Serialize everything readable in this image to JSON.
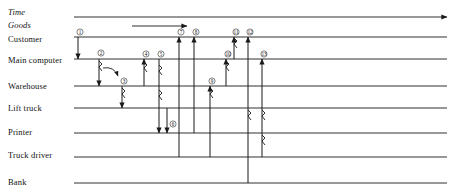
{
  "diagram": {
    "kind": "interaction-sequence-diagram",
    "colors": {
      "line": "#1a1a1a",
      "text": "#111111",
      "background": "#ffffff"
    },
    "geometry": {
      "line_start_x": 74,
      "line_end_x": 447,
      "label_x": 8
    },
    "axes": [
      {
        "id": "time",
        "label": "Time",
        "label_y": 14,
        "line_y": 17,
        "arrow": true,
        "x1": 74,
        "x2": 447
      },
      {
        "id": "goods",
        "label": "Goods",
        "label_y": 27,
        "line_y": 26,
        "arrow": true,
        "x1": 132,
        "x2": 187
      }
    ],
    "lanes": [
      {
        "id": "customer",
        "label": "Customer",
        "label_y": 41,
        "line_y": 37
      },
      {
        "id": "main-computer",
        "label": "Main computer",
        "label_y": 62,
        "line_y": 59
      },
      {
        "id": "warehouse",
        "label": "Warehouse",
        "label_y": 88,
        "line_y": 86
      },
      {
        "id": "lift-truck",
        "label": "Lift truck",
        "label_y": 110,
        "line_y": 108
      },
      {
        "id": "printer",
        "label": "Printer",
        "label_y": 134,
        "line_y": 133
      },
      {
        "id": "truck-driver",
        "label": "Truck driver",
        "label_y": 157,
        "line_y": 157
      },
      {
        "id": "bank",
        "label": "Bank",
        "label_y": 184,
        "line_y": 183
      }
    ],
    "steps": [
      {
        "n": "1",
        "label_x": 80,
        "label_y": 32,
        "from": "customer",
        "to": "main-computer",
        "x": 78,
        "direction": "down"
      },
      {
        "n": "2",
        "label_x": 101,
        "label_y": 53,
        "from": "main-computer",
        "to": "warehouse",
        "x": 99,
        "direction": "down"
      },
      {
        "n": "3",
        "label_x": 124,
        "label_y": 81,
        "from": "warehouse",
        "to": "lift-truck",
        "x": 122,
        "direction": "down"
      },
      {
        "n": "4",
        "label_x": 146,
        "label_y": 54,
        "from": "warehouse",
        "to": "main-computer",
        "x": 144,
        "direction": "up"
      },
      {
        "n": "5",
        "label_x": 161,
        "label_y": 54,
        "from": "main-computer",
        "to": "printer",
        "x": 159,
        "direction": "down"
      },
      {
        "n": "6",
        "label_x": 173,
        "label_y": 124,
        "from": "lift-truck",
        "to": "printer",
        "x": 167,
        "direction": "down"
      },
      {
        "n": "7",
        "label_x": 181,
        "label_y": 32,
        "from": "truck-driver",
        "to": "customer",
        "x": 179,
        "direction": "up"
      },
      {
        "n": "8",
        "label_x": 196,
        "label_y": 32,
        "from": "printer",
        "to": "customer",
        "x": 194,
        "direction": "up"
      },
      {
        "n": "9",
        "label_x": 212,
        "label_y": 81,
        "from": "truck-driver",
        "to": "warehouse",
        "x": 210,
        "direction": "up"
      },
      {
        "n": "10",
        "label_x": 228,
        "label_y": 54,
        "from": "warehouse",
        "to": "main-computer",
        "x": 226,
        "direction": "up"
      },
      {
        "n": "11",
        "label_x": 236,
        "label_y": 32,
        "from": "main-computer",
        "to": "customer",
        "x": 234,
        "direction": "up"
      },
      {
        "n": "12",
        "label_x": 250,
        "label_y": 32,
        "from": "bank",
        "to": "customer",
        "x": 248,
        "direction": "down"
      },
      {
        "n": "13",
        "label_x": 264,
        "label_y": 54,
        "from": "truck-driver",
        "to": "main-computer",
        "x": 262,
        "direction": "up"
      }
    ]
  }
}
